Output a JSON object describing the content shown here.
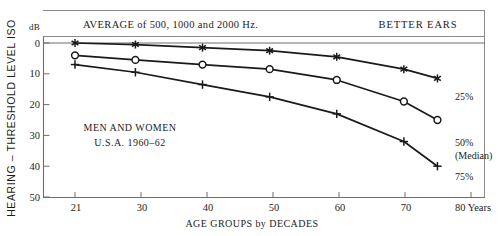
{
  "chart_data": {
    "type": "line",
    "title": "",
    "header_left": "AVERAGE of 500, 1000 and 2000 Hz.",
    "header_right": "BETTER EARS",
    "annotation_line1": "MEN AND WOMEN",
    "annotation_line2": "U.S.A.  1960–62",
    "xlabel": "AGE GROUPS by DECADES",
    "ylabel": "HEARING – THRESHOLD LEVEL   ISO",
    "y_unit_label": "dB",
    "x_tick_labels": [
      "21",
      "30",
      "40",
      "50",
      "60",
      "70",
      "80 Years"
    ],
    "x_tick_values": [
      21,
      30,
      40,
      50,
      60,
      70,
      80
    ],
    "y_tick_labels": [
      "0",
      "10",
      "20",
      "30",
      "40",
      "50"
    ],
    "y_tick_values": [
      0,
      10,
      20,
      30,
      40,
      50
    ],
    "xlim": [
      18,
      82
    ],
    "ylim": [
      0,
      50
    ],
    "y_axis_inverted": true,
    "grid": false,
    "legend_position": "inline-right",
    "x": [
      21,
      30,
      40,
      50,
      60,
      70,
      75
    ],
    "series": [
      {
        "name": "25%",
        "label": "25%",
        "label_line2": "",
        "marker": "asterisk-star-marker",
        "color": "#1a1a1a",
        "values": [
          0,
          0.5,
          1.5,
          2.5,
          4.5,
          8.5,
          11.5
        ]
      },
      {
        "name": "50% (Median)",
        "label": "50%",
        "label_line2": "(Median)",
        "marker": "open-circle-marker",
        "color": "#1a1a1a",
        "values": [
          4,
          5.5,
          7,
          8.5,
          12,
          19,
          25
        ]
      },
      {
        "name": "75%",
        "label": "75%",
        "label_line2": "",
        "marker": "plus-cross-marker",
        "color": "#1a1a1a",
        "values": [
          7,
          9.5,
          13.5,
          17.5,
          23,
          32,
          40
        ]
      }
    ]
  }
}
